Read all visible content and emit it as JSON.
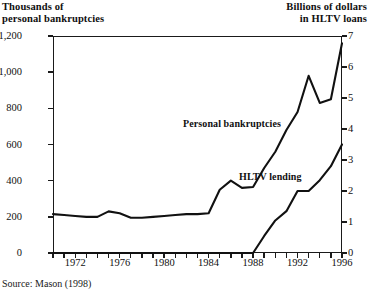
{
  "header": {
    "left_line1": "Thousands of",
    "left_line2": "personal bankruptcies",
    "right_line1": "Billions of dollars",
    "right_line2": "in HLTV loans"
  },
  "source_note": "Source: Mason (1998)",
  "chart_data": {
    "type": "line",
    "title": "",
    "xlabel": "",
    "grid": false,
    "legend": "inline-annotations",
    "x": [
      1970,
      1971,
      1972,
      1973,
      1974,
      1975,
      1976,
      1977,
      1978,
      1979,
      1980,
      1981,
      1982,
      1983,
      1984,
      1985,
      1986,
      1987,
      1988,
      1989,
      1990,
      1991,
      1992,
      1993,
      1994,
      1995,
      1996
    ],
    "xlim": [
      1970,
      1996
    ],
    "xticks": [
      1970,
      1971,
      1972,
      1973,
      1974,
      1975,
      1976,
      1977,
      1978,
      1979,
      1980,
      1981,
      1982,
      1983,
      1984,
      1985,
      1986,
      1987,
      1988,
      1989,
      1990,
      1991,
      1992,
      1993,
      1994,
      1995,
      1996
    ],
    "xticklabels": [
      {
        "x": 1972,
        "label": "1972"
      },
      {
        "x": 1976,
        "label": "1976"
      },
      {
        "x": 1980,
        "label": "1980"
      },
      {
        "x": 1984,
        "label": "1984"
      },
      {
        "x": 1988,
        "label": "1988"
      },
      {
        "x": 1992,
        "label": "1992"
      },
      {
        "x": 1996,
        "label": "1996"
      }
    ],
    "left_axis": {
      "label": "Thousands of personal bankruptcies",
      "ylim": [
        0,
        1200
      ],
      "ticks": [
        0,
        200,
        400,
        600,
        800,
        1000,
        1200
      ],
      "ticklabels": [
        "0",
        "200",
        "400",
        "600",
        "800",
        "1,000",
        "1,200"
      ]
    },
    "right_axis": {
      "label": "Billions of dollars in HLTV loans",
      "ylim": [
        0,
        7
      ],
      "ticks": [
        0,
        1,
        2,
        3,
        4,
        5,
        6,
        7
      ],
      "ticklabels": [
        "0",
        "1",
        "2",
        "3",
        "4",
        "5",
        "6",
        "7"
      ]
    },
    "series": [
      {
        "name": "Personal bankruptcies",
        "axis": "left",
        "units": "thousands",
        "annotation": "Personal bankruptcies",
        "values": [
          215,
          210,
          205,
          200,
          200,
          230,
          220,
          195,
          195,
          200,
          205,
          210,
          215,
          215,
          220,
          350,
          400,
          360,
          365,
          470,
          560,
          680,
          780,
          980,
          830,
          850,
          1160
        ]
      },
      {
        "name": "HLTV lending",
        "axis": "right",
        "units": "billions of dollars",
        "annotation": "HLTV lending",
        "values": [
          0,
          0,
          0,
          0,
          0,
          0,
          0,
          0,
          0,
          0,
          0,
          0,
          0,
          0,
          0,
          0,
          0,
          0,
          0,
          0.55,
          1.05,
          1.35,
          2.0,
          2.0,
          2.35,
          2.8,
          3.5
        ]
      }
    ]
  }
}
